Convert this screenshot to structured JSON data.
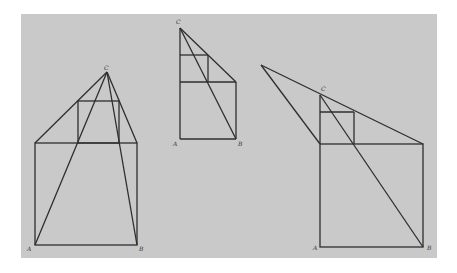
{
  "figures": [
    {
      "id": "left",
      "labels": {
        "A": "A",
        "B": "B",
        "C": "C"
      },
      "points": {
        "C": [
          107,
          72
        ],
        "A": [
          35,
          245
        ],
        "B": [
          137,
          245
        ],
        "BigTL": [
          35,
          143
        ],
        "BigTR": [
          137,
          143
        ],
        "SmallTL": [
          78,
          101
        ],
        "SmallTR": [
          119,
          101
        ]
      }
    },
    {
      "id": "middle",
      "labels": {
        "A": "A",
        "B": "B",
        "C": "C"
      },
      "points": {
        "C": [
          180,
          28
        ],
        "A": [
          180,
          139
        ],
        "B": [
          236,
          139
        ],
        "BigTR": [
          236,
          82
        ],
        "BigTL": [
          180,
          82
        ],
        "SmallTL": [
          180,
          55
        ],
        "SmallTR": [
          208,
          55
        ],
        "SmallBR": [
          208,
          82
        ]
      }
    },
    {
      "id": "right",
      "labels": {
        "A": "A",
        "B": "B",
        "C": "C"
      },
      "points": {
        "P": [
          261,
          65
        ],
        "C": [
          320,
          95
        ],
        "A": [
          320,
          247
        ],
        "B": [
          423,
          247
        ],
        "BigTL": [
          320,
          144
        ],
        "BigTR": [
          423,
          144
        ],
        "SmallTL": [
          320,
          112
        ],
        "SmallTR": [
          354,
          112
        ],
        "SmallBR": [
          354,
          144
        ]
      }
    }
  ],
  "colors": {
    "panel": "#c9c9c9",
    "line": "#2e2e2e"
  }
}
